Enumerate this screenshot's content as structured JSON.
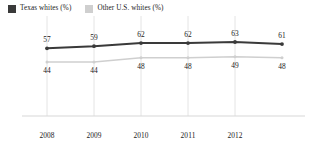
{
  "chart_data": {
    "type": "line",
    "title": "",
    "subtitle": "",
    "xlabel": "",
    "ylabel": "",
    "grid": true,
    "legend_position": "top-left",
    "x": [
      "2008",
      "2009",
      "2010",
      "2011",
      "2012",
      ""
    ],
    "tick_labels": [
      "2008",
      "2009",
      "2010",
      "2011",
      "2012"
    ],
    "ylim": [
      0,
      70
    ],
    "series": [
      {
        "name": "Texas whites (%)",
        "color": "#3a3a3a",
        "values": [
          57,
          59,
          62,
          62,
          63,
          61
        ],
        "labels": [
          "57",
          "59",
          "62",
          "62",
          "63",
          "61"
        ]
      },
      {
        "name": "Other U.S. whites (%)",
        "color": "#cfcfcf",
        "values": [
          44,
          44,
          48,
          48,
          49,
          48
        ],
        "labels": [
          "44",
          "44",
          "48",
          "48",
          "49",
          "48"
        ]
      }
    ]
  },
  "legend": {
    "items": [
      {
        "label": "Texas whites (%)",
        "color": "#3a3a3a"
      },
      {
        "label": "Other U.S. whites (%)",
        "color": "#cfcfcf"
      }
    ]
  },
  "axis": {
    "baseline_color": "#d8d8d8",
    "gridline_color": "#e4e4e4"
  }
}
